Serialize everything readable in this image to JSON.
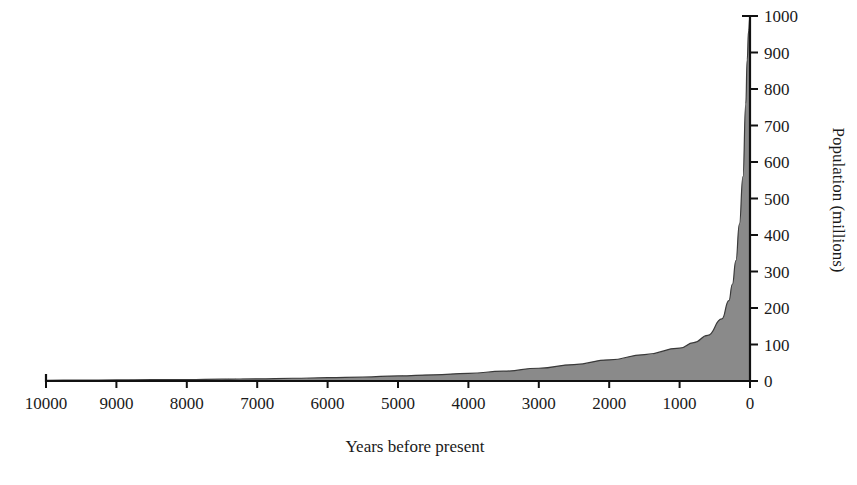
{
  "chart_data": {
    "type": "area",
    "title": "",
    "subtitle": "",
    "xlabel": "Years before present",
    "ylabel": "Population (millions)",
    "x_axis_reversed": true,
    "y_axis_side": "right",
    "grid": false,
    "legend": "none",
    "xlim": [
      0,
      10000
    ],
    "ylim": [
      0,
      1000
    ],
    "xticks": [
      10000,
      9000,
      8000,
      7000,
      6000,
      5000,
      4000,
      3000,
      2000,
      1000,
      0
    ],
    "xtick_labels": [
      "10000",
      "9000",
      "8000",
      "7000",
      "6000",
      "5000",
      "4000",
      "3000",
      "2000",
      "1000",
      "0"
    ],
    "yticks": [
      0,
      100,
      200,
      300,
      400,
      500,
      600,
      700,
      800,
      900,
      1000
    ],
    "ytick_labels": [
      "0",
      "100",
      "200",
      "300",
      "400",
      "500",
      "600",
      "700",
      "800",
      "900",
      "1000"
    ],
    "series_name": "World population",
    "fill_color": "#8a8a8a",
    "line_color": "#3a3a3a",
    "x": [
      10000,
      9500,
      9000,
      8500,
      8000,
      7500,
      7000,
      6500,
      6000,
      5500,
      5000,
      4500,
      4000,
      3500,
      3000,
      2500,
      2000,
      1500,
      1000,
      800,
      600,
      400,
      300,
      250,
      200,
      150,
      100,
      60,
      40,
      20,
      0
    ],
    "values": [
      2,
      2.5,
      3,
      3.5,
      4,
      5,
      6,
      7.5,
      9,
      11,
      14,
      17,
      21,
      27,
      35,
      45,
      58,
      72,
      90,
      105,
      125,
      170,
      220,
      265,
      330,
      430,
      560,
      760,
      880,
      960,
      1000
    ]
  },
  "axes": {
    "x_label": "Years before present",
    "y_label": "Population (millions)"
  }
}
